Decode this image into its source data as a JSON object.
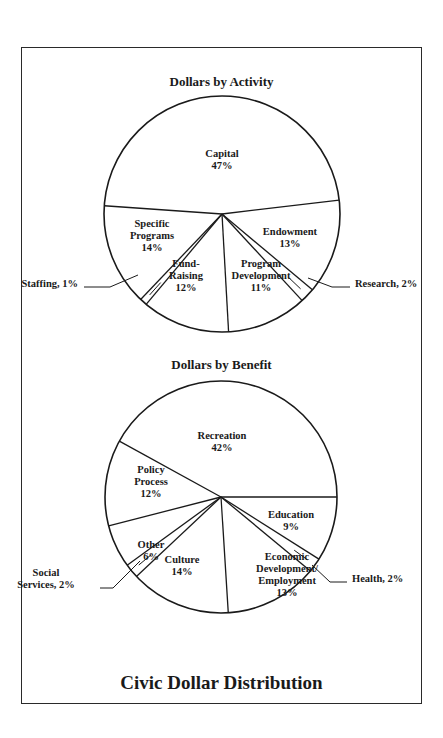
{
  "title": "Civic Dollar Distribution",
  "chart_data": [
    {
      "type": "pie",
      "title": "Dollars by Activity",
      "categories": [
        "Capital",
        "Endowment",
        "Research",
        "Program Development",
        "Fund-Raising",
        "Staffing",
        "Specific Programs"
      ],
      "values": [
        47,
        13,
        2,
        11,
        12,
        1,
        14
      ],
      "unit": "%",
      "labels": [
        {
          "lines": [
            "Capital",
            "47%"
          ]
        },
        {
          "lines": [
            "Endowment",
            "13%"
          ]
        },
        {
          "lines": [
            "Research, 2%"
          ]
        },
        {
          "lines": [
            "Program",
            "Development",
            "11%"
          ]
        },
        {
          "lines": [
            "Fund-",
            "Raising",
            "12%"
          ]
        },
        {
          "lines": [
            "Staffing, 1%"
          ]
        },
        {
          "lines": [
            "Specific",
            "Programs",
            "14%"
          ]
        }
      ]
    },
    {
      "type": "pie",
      "title": "Dollars by Benefit",
      "categories": [
        "Recreation",
        "Education",
        "Health",
        "Economic Development/Employment",
        "Culture",
        "Social Services",
        "Other",
        "Policy Process"
      ],
      "values": [
        42,
        9,
        2,
        13,
        14,
        2,
        6,
        12
      ],
      "unit": "%",
      "labels": [
        {
          "lines": [
            "Recreation",
            "42%"
          ]
        },
        {
          "lines": [
            "Education",
            "9%"
          ]
        },
        {
          "lines": [
            "Health, 2%"
          ]
        },
        {
          "lines": [
            "Economic",
            "Development/",
            "Employment",
            "13%"
          ]
        },
        {
          "lines": [
            "Culture",
            "14%"
          ]
        },
        {
          "lines": [
            "Social",
            "Services, 2%"
          ]
        },
        {
          "lines": [
            "Other",
            "6%"
          ]
        },
        {
          "lines": [
            "Policy",
            "Process",
            "12%"
          ]
        }
      ]
    }
  ]
}
